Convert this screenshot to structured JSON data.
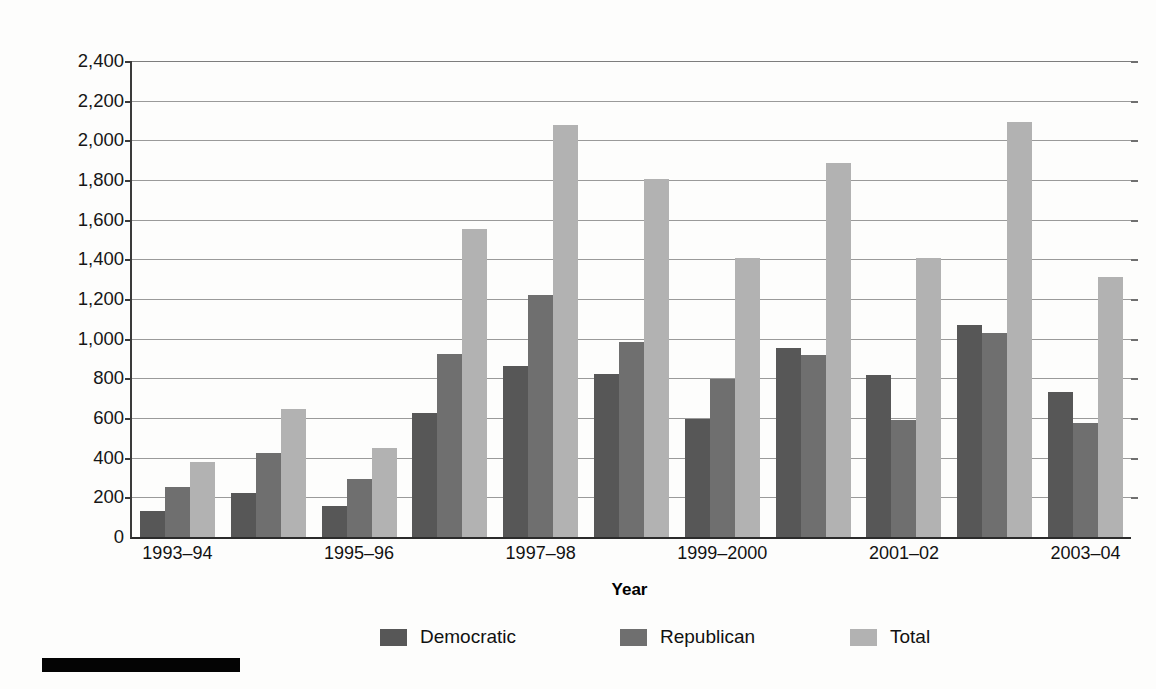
{
  "chart_data": {
    "type": "bar",
    "title": "",
    "xlabel": "Year",
    "ylabel": "Millions of Dollars",
    "ylim": [
      0,
      2400
    ],
    "ytick_step": 200,
    "grid": true,
    "legend_position": "bottom",
    "ytick_labels": [
      "2,400",
      "2,200",
      "2,000",
      "1,800",
      "1,600",
      "1,400",
      "1,200",
      "1,000",
      "800",
      "600",
      "400",
      "200",
      "0"
    ],
    "ytick_values": [
      2400,
      2200,
      2000,
      1800,
      1600,
      1400,
      1200,
      1000,
      800,
      600,
      400,
      200,
      0
    ],
    "categories": [
      "1993–94",
      "1995–96",
      "1997–98",
      "1999–2000",
      "2001–02",
      "2003–04",
      "2005–06",
      "2007–08",
      "2009–10",
      "2011–12",
      "2013–14"
    ],
    "series": [
      {
        "name": "Democratic",
        "color": "#575757",
        "values": [
          130,
          220,
          155,
          625,
          860,
          820,
          595,
          955,
          815,
          1070,
          730
        ]
      },
      {
        "name": "Republican",
        "color": "#6f6f6f",
        "values": [
          250,
          425,
          290,
          925,
          1220,
          985,
          795,
          920,
          590,
          1030,
          575
        ]
      },
      {
        "name": "Total",
        "color": "#b2b2b2",
        "values": [
          380,
          645,
          450,
          1555,
          2075,
          1805,
          1405,
          1885,
          1405,
          2095,
          1310
        ]
      }
    ]
  },
  "legend": {
    "items": [
      {
        "label": "Democratic",
        "swatch": "#575757"
      },
      {
        "label": "Republican",
        "swatch": "#6f6f6f"
      },
      {
        "label": "Total",
        "swatch": "#b2b2b2"
      }
    ]
  },
  "footer": {
    "rule_color": "#040404"
  }
}
